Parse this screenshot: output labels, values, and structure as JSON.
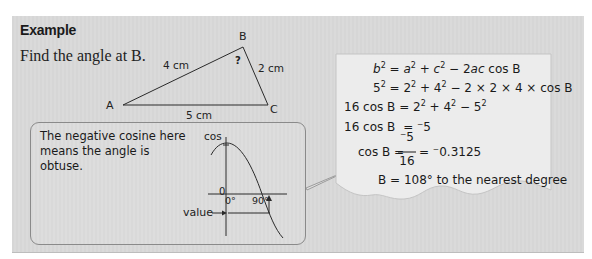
{
  "example": {
    "title": "Example",
    "question": "Find the angle at B."
  },
  "triangle": {
    "vertices": {
      "A": "A",
      "B": "B",
      "C": "C"
    },
    "sides": {
      "AB": "4 cm",
      "BC": "2 cm",
      "AC": "5 cm"
    },
    "unknown_angle_mark": "?"
  },
  "callout": {
    "text": "The negative cosine here means the angle is obtuse.",
    "graph": {
      "y_axis_label": "cos",
      "origin_label": "0",
      "x_tick_0": "0°",
      "x_tick_90": "90°",
      "value_label": "value"
    }
  },
  "solution": {
    "line1": {
      "lhs": "b",
      "rhs": "= a² + c² − 2ac cos B"
    },
    "line2": {
      "lhs": "5²",
      "rhs": "= 2² + 4² − 2 × 2 × 4 × cos B"
    },
    "line3": {
      "lhs": "16 cos B",
      "rhs": "= 2² + 4² − 5²"
    },
    "line4": {
      "lhs": "16 cos B",
      "rhs": "= ⁻5"
    },
    "line5": {
      "lhs": "cos B =",
      "numerator": "⁻5",
      "denominator": "16",
      "result": "= ⁻0.3125"
    },
    "line6": {
      "text": "B = 108° to the nearest degree"
    }
  },
  "colors": {
    "panel_bg": "#d8d8d8",
    "paper_bg": "#ececec",
    "ink": "#1a1a1a",
    "callout_border": "#8a8a8a"
  }
}
